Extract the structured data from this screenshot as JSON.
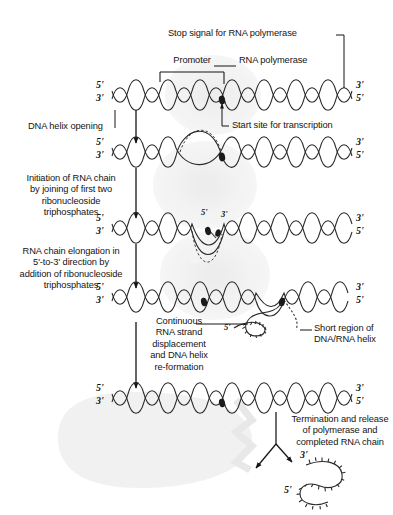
{
  "figure": {
    "ink": "#141414",
    "watermark_color": "#eeeeee"
  },
  "callouts": {
    "stop_signal": "Stop signal for RNA polymerase",
    "promoter": "Promoter",
    "rna_polymerase": "RNA polymerase",
    "start_site": "Start site for transcription",
    "continuous_displacement": "Continuous\nRNA strand\ndisplacement\nand DNA helix\nre-formation",
    "short_region": "Short region of\nDNA/RNA helix",
    "termination": "Termination and release\nof polymerase and\ncompleted RNA chain"
  },
  "steps": [
    {
      "id": "helix-opening",
      "label": "DNA helix opening"
    },
    {
      "id": "initiation",
      "label": "Initiation of RNA chain\nby joining of first two\nribonucleoside\ntriphosphates"
    },
    {
      "id": "elongation",
      "label": "RNA chain elongation in\n5'-to-3' direction by\naddition of ribonucleoside\ntriphosphates"
    }
  ],
  "strands": [
    {
      "id": "strand-1",
      "stage": "promoter-binding",
      "left_top": "5'",
      "left_bottom": "3'",
      "right_top": "3'",
      "right_bottom": "5'"
    },
    {
      "id": "strand-2",
      "stage": "helix-open-bubble",
      "left_top": "5'",
      "left_bottom": "3'",
      "right_top": "3'",
      "right_bottom": "5'"
    },
    {
      "id": "strand-3",
      "stage": "initiation",
      "left_top": "5'",
      "left_bottom": "3'",
      "right_top": "3'",
      "right_bottom": "5'",
      "rna_five_prime": "5'",
      "rna_three_prime": "3'"
    },
    {
      "id": "strand-4",
      "stage": "elongation",
      "left_top": "5'",
      "left_bottom": "3'",
      "right_top": "3'",
      "right_bottom": "5'",
      "rna_five_prime": "5'"
    },
    {
      "id": "strand-5",
      "stage": "re-formed",
      "left_top": "5'",
      "left_bottom": "3'",
      "right_top": "3'",
      "right_bottom": "5'"
    }
  ],
  "product": {
    "id": "completed-rna-chain",
    "five_prime": "5'",
    "three_prime": "3'"
  }
}
